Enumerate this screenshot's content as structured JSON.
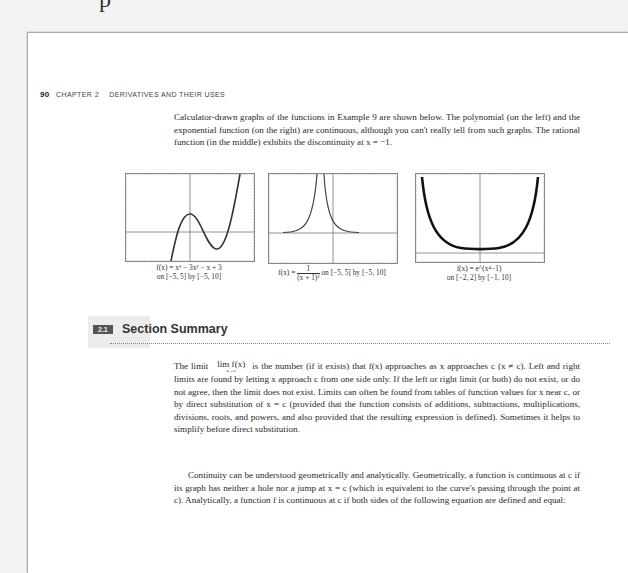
{
  "top_fragment": "p",
  "running_head": {
    "page_number": "90",
    "chapter": "CHAPTER 2",
    "title": "DERIVATIVES AND THEIR USES"
  },
  "intro_paragraph": "Calculator-drawn graphs of the functions in Example 9 are shown below. The polynomial (on the left) and the exponential function (on the right) are continuous, although you can't really tell from such graphs. The rational function (in the middle) exhibits the discontinuity at x = −1.",
  "graphs": [
    {
      "name": "polynomial",
      "caption_line1": "f(x) = x³ − 3x² − x + 3",
      "caption_line2": "on [−5, 5] by [−5, 10]"
    },
    {
      "name": "rational",
      "caption_prefix": "f(x) = ",
      "caption_numerator": "1",
      "caption_denominator": "(x + 1)²",
      "caption_suffix": " on [−5, 5] by [−5, 10]"
    },
    {
      "name": "exponential",
      "caption_line1": "f(x) = e^(x⁴−1)",
      "caption_line2": "on [−2, 2] by [−1, 10]"
    }
  ],
  "section": {
    "badge": "2.1",
    "title": "Section Summary"
  },
  "summary": {
    "p1_start": "The limit",
    "lim_word": "lim f(x)",
    "lim_sub": "x→c",
    "p1_rest": "is the number (if it exists) that f(x) approaches as x approaches c (x ≠ c). Left and right limits are found by letting x approach c from one side only. If the left or right limit (or both) do not exist, or do not agree, then the limit does not exist. Limits can often be found from tables of function values for x near c, or by direct substitution of  x = c  (provided that the function consists of additions, subtractions, multiplications, divisions, roots, and powers, and also provided that the resulting expression is defined). Sometimes it helps to simplify before direct substitution.",
    "p2": "Continuity can be understood geometrically and analytically. Geometrically, a function is continuous at c if its graph has neither a hole nor a jump at  x = c  (which is equivalent to the curve's passing through the point at c). Analytically, a function f is continuous at c if both sides of the following equation are defined and equal:"
  }
}
